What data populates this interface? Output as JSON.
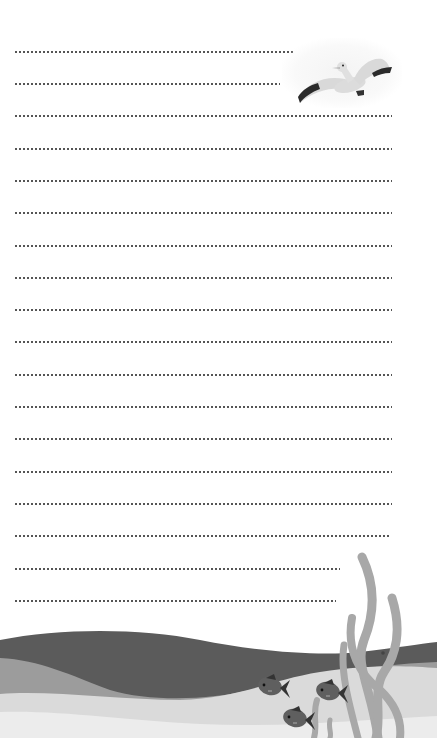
{
  "document": {
    "type": "lined writing paper",
    "line_style": "dotted",
    "line_color": "#555555",
    "lines": [
      {
        "y": 52,
        "x_end": 294
      },
      {
        "y": 84,
        "x_end": 280
      },
      {
        "y": 116,
        "x_end": 392
      },
      {
        "y": 149,
        "x_end": 392
      },
      {
        "y": 181,
        "x_end": 392
      },
      {
        "y": 213,
        "x_end": 392
      },
      {
        "y": 246,
        "x_end": 392
      },
      {
        "y": 278,
        "x_end": 392
      },
      {
        "y": 310,
        "x_end": 392
      },
      {
        "y": 342,
        "x_end": 392
      },
      {
        "y": 375,
        "x_end": 392
      },
      {
        "y": 407,
        "x_end": 392
      },
      {
        "y": 439,
        "x_end": 392
      },
      {
        "y": 472,
        "x_end": 392
      },
      {
        "y": 504,
        "x_end": 392
      },
      {
        "y": 536,
        "x_end": 391
      },
      {
        "y": 569,
        "x_end": 340
      },
      {
        "y": 601,
        "x_end": 336
      }
    ]
  },
  "decorations": {
    "bird": {
      "icon": "seagull-icon",
      "colors": {
        "body": "#d9d9d9",
        "wingtip": "#2a2a2a"
      }
    },
    "waves": {
      "colors": {
        "dark": "#5b5b5b",
        "mid": "#9c9c9c",
        "light": "#dadada",
        "lightest": "#ececec"
      }
    },
    "fish": {
      "icon": "fish-icon",
      "count": 3,
      "color": "#5f5f5f"
    },
    "seaweed": {
      "icon": "seaweed-icon",
      "color": "#a8a8a8"
    }
  }
}
